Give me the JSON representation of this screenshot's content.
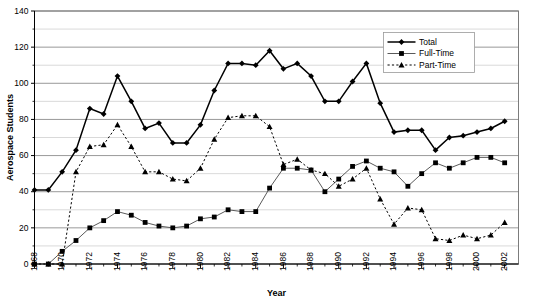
{
  "chart_data": {
    "type": "line",
    "title": "",
    "xlabel": "Year",
    "ylabel": "Aerospace Students",
    "xlim": [
      1968,
      2003
    ],
    "ylim": [
      0,
      140
    ],
    "ytick_step": 20,
    "yminor_step": 10,
    "xtick_step": 1,
    "xlabel_step": 2,
    "grid": true,
    "legend_position": "top-right",
    "x": [
      1968,
      1969,
      1970,
      1971,
      1972,
      1973,
      1974,
      1975,
      1976,
      1977,
      1978,
      1979,
      1980,
      1981,
      1982,
      1983,
      1984,
      1985,
      1986,
      1987,
      1988,
      1989,
      1990,
      1991,
      1992,
      1993,
      1994,
      1995,
      1996,
      1997,
      1998,
      1999,
      2000,
      2001,
      2002
    ],
    "xtick_labels": [
      "1968",
      "1970",
      "1972",
      "1974",
      "1976",
      "1978",
      "1980",
      "1982",
      "1984",
      "1986",
      "1988",
      "1990",
      "1992",
      "1994",
      "1996",
      "1998",
      "2000",
      "2002"
    ],
    "ytick_labels": [
      "0",
      "20",
      "40",
      "60",
      "80",
      "100",
      "120",
      "140"
    ],
    "series": [
      {
        "name": "Total",
        "marker": "diamond",
        "linestyle": "solid",
        "color": "#000000",
        "values": [
          41,
          41,
          51,
          63,
          86,
          83,
          104,
          90,
          75,
          78,
          67,
          67,
          77,
          96,
          111,
          111,
          110,
          118,
          108,
          111,
          104,
          90,
          90,
          101,
          111,
          89,
          73,
          74,
          74,
          63,
          70,
          71,
          73,
          75,
          79
        ]
      },
      {
        "name": "Full-Time",
        "marker": "square",
        "linestyle": "solid",
        "color": "#000000",
        "values": [
          0,
          0,
          7,
          13,
          20,
          24,
          29,
          27,
          23,
          21,
          20,
          21,
          25,
          26,
          30,
          29,
          29,
          42,
          53,
          53,
          52,
          40,
          47,
          54,
          57,
          53,
          51,
          43,
          50,
          56,
          53,
          56,
          59,
          59,
          56
        ]
      },
      {
        "name": "Part-Time",
        "marker": "triangle",
        "linestyle": "dotted",
        "color": "#000000",
        "values": [
          0,
          0,
          0,
          51,
          65,
          66,
          77,
          65,
          51,
          51,
          47,
          46,
          53,
          69,
          81,
          82,
          82,
          76,
          55,
          58,
          52,
          50,
          43,
          47,
          53,
          36,
          22,
          31,
          30,
          14,
          13,
          16,
          14,
          16,
          23
        ]
      }
    ]
  },
  "legend": {
    "items": [
      {
        "label": "Total"
      },
      {
        "label": "Full-Time"
      },
      {
        "label": "Part-Time"
      }
    ]
  },
  "caption": ""
}
